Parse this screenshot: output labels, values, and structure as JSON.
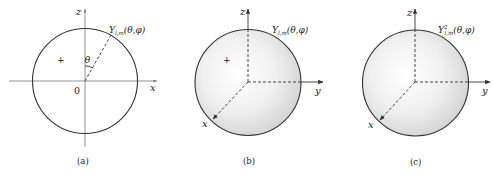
{
  "figure": {
    "panels": [
      {
        "id": "a",
        "caption": "(a)",
        "axes": {
          "vertical": "z",
          "horizontal": "x"
        },
        "origin_label": "0",
        "angle_label": "θ",
        "sign_label": "+",
        "function_label": {
          "base": "Y",
          "subscript": "l,m",
          "superscript": "",
          "args": "(θ,φ)"
        }
      },
      {
        "id": "b",
        "caption": "(b)",
        "axes": {
          "vertical": "z",
          "horizontal": "y",
          "diagonal": "x"
        },
        "sign_label": "+",
        "function_label": {
          "base": "Y",
          "subscript": "l,m",
          "superscript": "",
          "args": "(θ,φ)"
        }
      },
      {
        "id": "c",
        "caption": "(c)",
        "axes": {
          "vertical": "z",
          "horizontal": "y",
          "diagonal": "x"
        },
        "function_label": {
          "base": "Y",
          "subscript": "l,m",
          "superscript": "2",
          "args": "(θ,φ)"
        }
      }
    ],
    "colors": {
      "stroke": "#333333",
      "axis": "#555555",
      "sphere_center": "#ffffff",
      "sphere_edge": "#d6d6d6",
      "text": "#222222"
    }
  }
}
